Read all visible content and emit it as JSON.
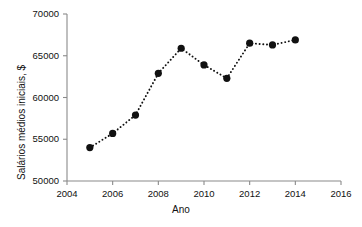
{
  "chart_data": {
    "type": "line",
    "title": "",
    "xlabel": "Ano",
    "ylabel": "Salários médios iniciais, $",
    "xlim": [
      2004,
      2016
    ],
    "ylim": [
      50000,
      70000
    ],
    "xticks": [
      2004,
      2006,
      2008,
      2010,
      2012,
      2014,
      2016
    ],
    "xtick_labels": [
      "2004",
      "2006",
      "2008",
      "2010",
      "2012",
      "2014",
      "2016"
    ],
    "yticks": [
      50000,
      55000,
      60000,
      65000,
      70000
    ],
    "ytick_labels": [
      "50000",
      "55000",
      "60000",
      "65000",
      "70000"
    ],
    "grid": false,
    "legend": "none",
    "linestyle": "dotted",
    "marker": "circle",
    "marker_color": "#111111",
    "line_color": "#111111",
    "axis_color": "#8a8a8a",
    "x": [
      2005,
      2006,
      2007,
      2008,
      2009,
      2010,
      2011,
      2012,
      2013,
      2014
    ],
    "values": [
      54000,
      55700,
      57900,
      62900,
      65900,
      63900,
      62300,
      66500,
      66300,
      66900
    ],
    "series": [
      {
        "name": "Salários médios iniciais",
        "points": [
          {
            "x": 2005,
            "y": 54000
          },
          {
            "x": 2006,
            "y": 55700
          },
          {
            "x": 2007,
            "y": 57900
          },
          {
            "x": 2008,
            "y": 62900
          },
          {
            "x": 2009,
            "y": 65900
          },
          {
            "x": 2010,
            "y": 63900
          },
          {
            "x": 2011,
            "y": 62300
          },
          {
            "x": 2012,
            "y": 66500
          },
          {
            "x": 2013,
            "y": 66300
          },
          {
            "x": 2014,
            "y": 66900
          }
        ]
      }
    ]
  }
}
